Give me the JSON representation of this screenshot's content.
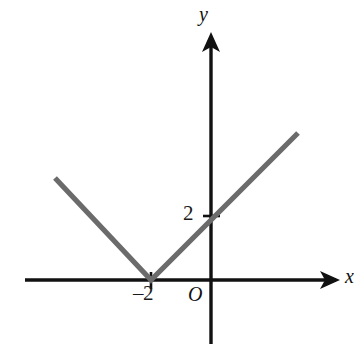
{
  "figure": {
    "kind": "cartesian-graph",
    "background_color": "#ffffff",
    "curve_color": "#6b6b6b",
    "axis_color": "#111111"
  },
  "axes": {
    "x_axis_label": "x",
    "y_axis_label": "y",
    "origin_label": "O",
    "x_tick_labels": [
      "–2"
    ],
    "y_tick_labels": [
      "2"
    ]
  },
  "chart_data": {
    "type": "line",
    "title": "",
    "xlabel": "x",
    "ylabel": "y",
    "grid": false,
    "legend": "none",
    "xlim": [
      -6.2,
      5.1
    ],
    "ylim": [
      -1.6,
      6.2
    ],
    "annotations": [
      {
        "text": "–2",
        "x": -2,
        "y": 0,
        "note": "vertex on x-axis"
      },
      {
        "text": "2",
        "x": 0,
        "y": 2,
        "note": "y-intercept"
      },
      {
        "text": "O",
        "x": 0,
        "y": 0,
        "note": "origin"
      }
    ],
    "series": [
      {
        "name": "y = |x + 2|",
        "color": "#6b6b6b",
        "x": [
          -5.2,
          -2,
          2.9
        ],
        "values": [
          3.4,
          0,
          4.9
        ]
      }
    ]
  }
}
